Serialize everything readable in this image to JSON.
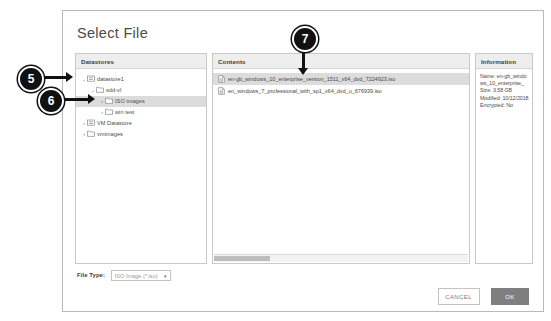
{
  "dialog": {
    "title": "Select File"
  },
  "panels": {
    "datastores": {
      "header": "Datastores",
      "tree": [
        {
          "label": "datastore1",
          "icon": "datastore-icon",
          "twisty": "expanded",
          "depth": 0,
          "selected": false
        },
        {
          "label": "sdd-vl",
          "icon": "folder-icon",
          "twisty": "expanded",
          "depth": 1,
          "selected": false
        },
        {
          "label": "ISO images",
          "icon": "folder-icon",
          "twisty": "collapsed",
          "depth": 2,
          "selected": true
        },
        {
          "label": "win test",
          "icon": "folder-icon",
          "twisty": "collapsed",
          "depth": 2,
          "selected": false
        },
        {
          "label": "VM Datastore",
          "icon": "datastore-icon",
          "twisty": "collapsed",
          "depth": 0,
          "selected": false
        },
        {
          "label": "vmimages",
          "icon": "folder-icon",
          "twisty": "collapsed",
          "depth": 0,
          "selected": false
        }
      ]
    },
    "contents": {
      "header": "Contents",
      "files": [
        {
          "name": "en-gb_windows_10_enterprise_version_1511_x64_dvd_7224923.iso",
          "icon": "iso-file-icon",
          "selected": true
        },
        {
          "name": "en_windows_7_professional_with_sp1_x64_dvd_u_676939.iso",
          "icon": "iso-file-icon",
          "selected": false
        }
      ],
      "scrollbar": "horizontal-scrollbar"
    },
    "information": {
      "header": "Information",
      "lines": [
        "Name: en-gb_windows_10_enterprise_",
        "Size: 3.58 GB",
        "Modified: 10/12/2018, 08:42:01",
        "Encrypted: No"
      ]
    }
  },
  "footer": {
    "file_type_label": "File Type:",
    "file_type_value": "ISO Image (*.iso)",
    "caret": "▾",
    "cancel_label": "CANCEL",
    "ok_label": "OK"
  },
  "callouts": [
    {
      "number": "5"
    },
    {
      "number": "6"
    },
    {
      "number": "7"
    }
  ],
  "colors": {
    "selection": "#dcdcdc",
    "ok_button": "#7f7f7f",
    "panel_header": "#eeeeee",
    "callout": "#111111"
  }
}
